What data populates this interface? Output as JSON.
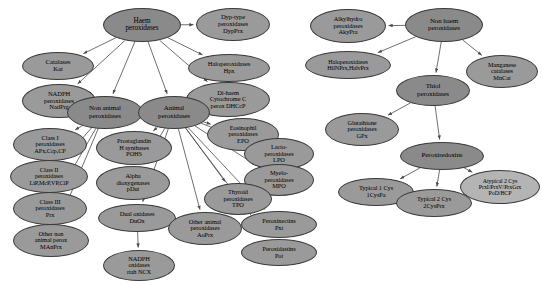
{
  "diagram": {
    "background": "#ffffff",
    "edge_color": "#4a4a4a",
    "colors": {
      "dark": "#8a8a8a",
      "mid": "#9a9a9a",
      "light": "#b4b4b4"
    },
    "nodes": [
      {
        "id": "haem",
        "label": "Haem\nperoxidases",
        "x": 103,
        "y": 8,
        "w": 78,
        "h": 34,
        "fs": 7.2,
        "fill": "dark"
      },
      {
        "id": "dyp",
        "label": "Dyp-type\nperoxidases\nDypPrx",
        "x": 196,
        "y": 8,
        "w": 74,
        "h": 33,
        "fs": 6.6,
        "fill": "mid"
      },
      {
        "id": "catalases",
        "label": "Catalases\nKat",
        "x": 22,
        "y": 52,
        "w": 72,
        "h": 28,
        "fs": 6.8,
        "fill": "mid"
      },
      {
        "id": "halo_hps",
        "label": "Haloperoxidases\nHpx",
        "x": 188,
        "y": 54,
        "w": 82,
        "h": 28,
        "fs": 6.6,
        "fill": "mid"
      },
      {
        "id": "nadph_prx",
        "label": "NADPH\nperoxidases\nNadPrg",
        "x": 22,
        "y": 84,
        "w": 74,
        "h": 34,
        "fs": 6.6,
        "fill": "mid"
      },
      {
        "id": "dihaem",
        "label": "Di-haem\nCytochrome C\nperox DHCcP",
        "x": 186,
        "y": 82,
        "w": 84,
        "h": 35,
        "fs": 6.4,
        "fill": "mid"
      },
      {
        "id": "nonanimal",
        "label": "Non animal\nperoxidases",
        "x": 67,
        "y": 96,
        "w": 76,
        "h": 33,
        "fs": 7.0,
        "fill": "dark"
      },
      {
        "id": "animal",
        "label": "Animal\nperoxidases",
        "x": 138,
        "y": 96,
        "w": 72,
        "h": 33,
        "fs": 7.0,
        "fill": "dark"
      },
      {
        "id": "class1",
        "label": "Class I\nperoxidases\nAPx,Ccp,CP",
        "x": 13,
        "y": 128,
        "w": 74,
        "h": 33,
        "fs": 6.4,
        "fill": "mid"
      },
      {
        "id": "class2",
        "label": "Class II\nperoxidases\nLiP,McP,VP,CiP",
        "x": 10,
        "y": 160,
        "w": 78,
        "h": 33,
        "fs": 6.2,
        "fill": "mid"
      },
      {
        "id": "class3",
        "label": "Class III\nperoxidases\nPrx",
        "x": 13,
        "y": 192,
        "w": 74,
        "h": 33,
        "fs": 6.4,
        "fill": "mid"
      },
      {
        "id": "othernon",
        "label": "Other non\nanimal perox\nMAnPrx",
        "x": 13,
        "y": 224,
        "w": 76,
        "h": 33,
        "fs": 6.4,
        "fill": "mid"
      },
      {
        "id": "pohs",
        "label": "Prostaglandin\nH synthases\nPOHS",
        "x": 96,
        "y": 131,
        "w": 76,
        "h": 34,
        "fs": 6.4,
        "fill": "mid"
      },
      {
        "id": "adiox",
        "label": "Alpha\ndioxygenases\npDut",
        "x": 96,
        "y": 166,
        "w": 74,
        "h": 34,
        "fs": 6.4,
        "fill": "mid"
      },
      {
        "id": "duox",
        "label": "Dual oxidases\nDuOx",
        "x": 98,
        "y": 204,
        "w": 78,
        "h": 28,
        "fs": 6.4,
        "fill": "mid"
      },
      {
        "id": "nox",
        "label": "NADPH\noxidases\nrtah NCX",
        "x": 103,
        "y": 250,
        "w": 72,
        "h": 31,
        "fs": 6.4,
        "fill": "mid"
      },
      {
        "id": "otheranimal",
        "label": "Other animal\nperoxidases\nAoPrx",
        "x": 168,
        "y": 212,
        "w": 74,
        "h": 33,
        "fs": 6.4,
        "fill": "mid"
      },
      {
        "id": "eosin",
        "label": "Eosinophil\nperoxidases\nEPO",
        "x": 207,
        "y": 118,
        "w": 72,
        "h": 33,
        "fs": 6.4,
        "fill": "mid"
      },
      {
        "id": "lacto",
        "label": "Lacto-\nperoxidases\nLPO",
        "x": 244,
        "y": 138,
        "w": 70,
        "h": 32,
        "fs": 6.4,
        "fill": "mid"
      },
      {
        "id": "myelo",
        "label": "Myelo-\nperoxidases\nMPO",
        "x": 244,
        "y": 164,
        "w": 70,
        "h": 32,
        "fs": 6.4,
        "fill": "mid"
      },
      {
        "id": "thyroid",
        "label": "Thyroid\nperoxidases\nTPO",
        "x": 204,
        "y": 183,
        "w": 68,
        "h": 32,
        "fs": 6.4,
        "fill": "mid"
      },
      {
        "id": "pxt",
        "label": "Peroxinectins\nPxt",
        "x": 241,
        "y": 211,
        "w": 76,
        "h": 27,
        "fs": 6.4,
        "fill": "mid"
      },
      {
        "id": "pot",
        "label": "Peroxidastins\nPot",
        "x": 241,
        "y": 239,
        "w": 76,
        "h": 27,
        "fs": 6.4,
        "fill": "mid"
      },
      {
        "id": "nonhaem",
        "label": "Non haem\nperoxidases",
        "x": 405,
        "y": 8,
        "w": 78,
        "h": 34,
        "fs": 7.0,
        "fill": "dark"
      },
      {
        "id": "alkyl",
        "label": "Alkylhydro\nperoxidases\nAkyPra",
        "x": 310,
        "y": 9,
        "w": 76,
        "h": 34,
        "fs": 6.4,
        "fill": "mid"
      },
      {
        "id": "halo_prx",
        "label": "Haloperoxidases\nHilNPrx,HalvPrx",
        "x": 305,
        "y": 51,
        "w": 86,
        "h": 28,
        "fs": 6.2,
        "fill": "mid"
      },
      {
        "id": "mncat",
        "label": "Manganese\ncatalases\nMnCat",
        "x": 466,
        "y": 55,
        "w": 72,
        "h": 33,
        "fs": 6.4,
        "fill": "mid"
      },
      {
        "id": "thiol",
        "label": "Thiol\nperoxidases",
        "x": 396,
        "y": 75,
        "w": 74,
        "h": 31,
        "fs": 7.0,
        "fill": "dark"
      },
      {
        "id": "gpx",
        "label": "Glutathione\nperoxidases\nGPx",
        "x": 325,
        "y": 113,
        "w": 74,
        "h": 33,
        "fs": 6.4,
        "fill": "mid"
      },
      {
        "id": "prdx",
        "label": "Peroxiredoxins",
        "x": 400,
        "y": 142,
        "w": 84,
        "h": 28,
        "fs": 7.0,
        "fill": "dark"
      },
      {
        "id": "typ1cys",
        "label": "Typical 1 Cys\n1CysPa",
        "x": 338,
        "y": 178,
        "w": 76,
        "h": 28,
        "fs": 6.4,
        "fill": "mid"
      },
      {
        "id": "typ2cys",
        "label": "Typical 2 Cys\n2CysPrx",
        "x": 396,
        "y": 189,
        "w": 76,
        "h": 28,
        "fs": 6.4,
        "fill": "mid"
      },
      {
        "id": "atyp2cys",
        "label": "Atypical 2 Cys\nPrxI/PrxV/PrxGrx\nPoD/BCP",
        "x": 460,
        "y": 170,
        "w": 80,
        "h": 34,
        "fs": 6.0,
        "fill": "light"
      }
    ],
    "edges": [
      {
        "from": "haem",
        "to": "dyp"
      },
      {
        "from": "haem",
        "to": "catalases"
      },
      {
        "from": "haem",
        "to": "halo_hps"
      },
      {
        "from": "haem",
        "to": "nadph_prx"
      },
      {
        "from": "haem",
        "to": "dihaem"
      },
      {
        "from": "haem",
        "to": "nonanimal"
      },
      {
        "from": "haem",
        "to": "animal"
      },
      {
        "from": "nonanimal",
        "to": "class1"
      },
      {
        "from": "nonanimal",
        "to": "class2"
      },
      {
        "from": "nonanimal",
        "to": "class3"
      },
      {
        "from": "nonanimal",
        "to": "othernon"
      },
      {
        "from": "animal",
        "to": "pohs"
      },
      {
        "from": "animal",
        "to": "adiox"
      },
      {
        "from": "animal",
        "to": "duox"
      },
      {
        "from": "animal",
        "to": "otheranimal"
      },
      {
        "from": "animal",
        "to": "eosin"
      },
      {
        "from": "animal",
        "to": "lacto"
      },
      {
        "from": "animal",
        "to": "myelo"
      },
      {
        "from": "animal",
        "to": "thyroid"
      },
      {
        "from": "animal",
        "to": "pxt"
      },
      {
        "from": "animal",
        "to": "pot"
      },
      {
        "from": "duox",
        "to": "nox"
      },
      {
        "from": "nonhaem",
        "to": "alkyl"
      },
      {
        "from": "nonhaem",
        "to": "halo_prx"
      },
      {
        "from": "nonhaem",
        "to": "mncat"
      },
      {
        "from": "nonhaem",
        "to": "thiol"
      },
      {
        "from": "thiol",
        "to": "gpx"
      },
      {
        "from": "thiol",
        "to": "prdx"
      },
      {
        "from": "prdx",
        "to": "typ1cys"
      },
      {
        "from": "prdx",
        "to": "typ2cys"
      },
      {
        "from": "prdx",
        "to": "atyp2cys"
      }
    ]
  }
}
